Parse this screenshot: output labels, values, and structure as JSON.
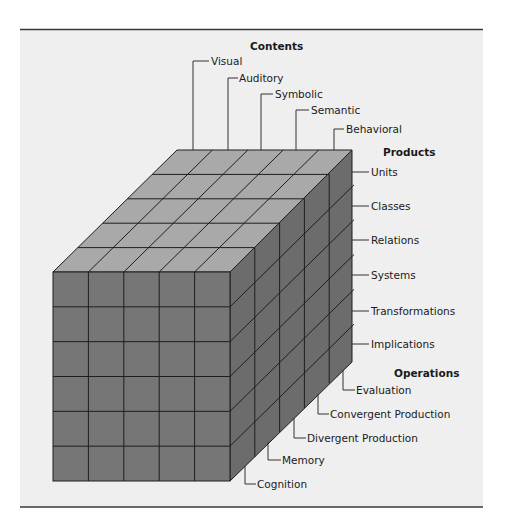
{
  "colors": {
    "page_background": "#ffffff",
    "panel_background": "#efefef",
    "rule": "#3a3a3a",
    "top_face": "#a9a9a9",
    "front_face": "#767676",
    "side_face": "#6c6c6c",
    "grid_line": "#1e1e1e"
  },
  "cube": {
    "front_columns": 5,
    "rows": 6,
    "depth": 5
  },
  "contents": {
    "header": "Contents",
    "items": [
      "Visual",
      "Auditory",
      "Symbolic",
      "Semantic",
      "Behavioral"
    ]
  },
  "products": {
    "header": "Products",
    "items": [
      "Units",
      "Classes",
      "Relations",
      "Systems",
      "Transformations",
      "Implications"
    ]
  },
  "operations": {
    "header": "Operations",
    "items": [
      "Evaluation",
      "Convergent Production",
      "Divergent Production",
      "Memory",
      "Cognition"
    ]
  }
}
